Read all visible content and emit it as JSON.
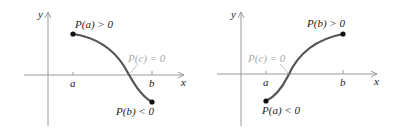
{
  "figure": {
    "panels": [
      {
        "id": "left",
        "axis_labels": {
          "x": "x",
          "y": "y"
        },
        "ticks": {
          "a": "a",
          "b": "b"
        },
        "annotations": {
          "start": "P(a) > 0",
          "end": "P(b) < 0",
          "root": "P(c) = 0"
        },
        "curve": "decreasing from P(a) > 0 to P(b) < 0, crossing the x-axis at c between a and b"
      },
      {
        "id": "right",
        "axis_labels": {
          "x": "x",
          "y": "y"
        },
        "ticks": {
          "a": "a",
          "b": "b"
        },
        "annotations": {
          "start": "P(a) < 0",
          "end": "P(b) > 0",
          "root": "P(c) = 0"
        },
        "curve": "increasing from P(a) < 0 to P(b) > 0, crossing the x-axis at c between a and b"
      }
    ],
    "colors": {
      "axis": "#9a9a9a",
      "curve": "#555555",
      "point": "#111111",
      "root_label": "#a8a8a8",
      "text": "#222222"
    }
  }
}
